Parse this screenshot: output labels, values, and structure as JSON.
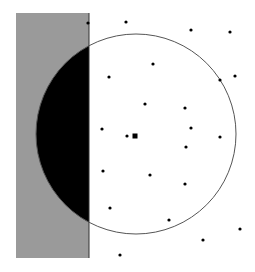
{
  "figure": {
    "width": 255,
    "height": 272,
    "background": "#ffffff",
    "shaded_region": {
      "x": 16,
      "y": 13,
      "width": 73,
      "height": 245,
      "fill": "#9a9a9a",
      "edge": "#333333"
    },
    "circle": {
      "cx": 136,
      "cy": 134,
      "r": 100,
      "stroke": "#555555"
    },
    "intersection_fill": "#000000",
    "center_marker": {
      "x": 135,
      "y": 136,
      "size": 5,
      "fill": "#000000"
    },
    "points": [
      [
        88,
        23
      ],
      [
        126,
        22
      ],
      [
        191,
        30
      ],
      [
        230,
        32
      ],
      [
        153,
        64
      ],
      [
        109,
        77
      ],
      [
        220,
        80
      ],
      [
        235,
        76
      ],
      [
        145,
        104
      ],
      [
        185,
        108
      ],
      [
        102,
        129
      ],
      [
        127,
        136
      ],
      [
        191,
        128
      ],
      [
        220,
        137
      ],
      [
        186,
        147
      ],
      [
        103,
        171
      ],
      [
        150,
        175
      ],
      [
        185,
        184
      ],
      [
        110,
        208
      ],
      [
        169,
        220
      ],
      [
        240,
        229
      ],
      [
        203,
        240
      ],
      [
        120,
        255
      ]
    ],
    "point_radius": 1.6,
    "point_fill": "#000000"
  }
}
